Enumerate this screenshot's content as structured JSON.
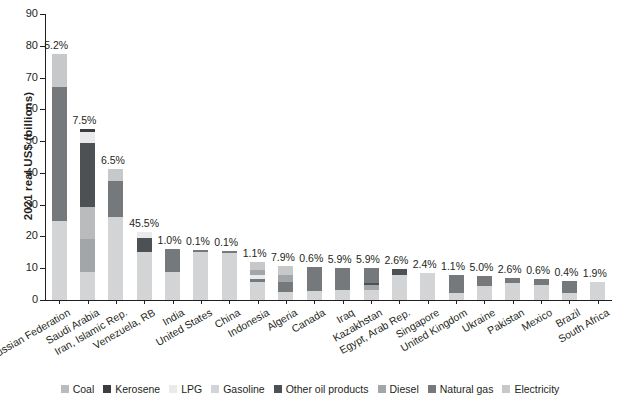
{
  "chart": {
    "type": "bar",
    "title": "",
    "ylabel": "2021 real US$ (billions)",
    "xlabel": ""
  },
  "axis": {
    "yticks": [
      "0",
      "10",
      "20",
      "30",
      "40",
      "50",
      "60",
      "70",
      "80",
      "90"
    ],
    "ymin": 0,
    "ymax": 90
  },
  "legend": {
    "items": [
      {
        "label": "Coal",
        "color": "#b9bbbd"
      },
      {
        "label": "Kerosene",
        "color": "#3b3d40"
      },
      {
        "label": "LPG",
        "color": "#e9eaeb"
      },
      {
        "label": "Gasoline",
        "color": "#d2d4d6"
      },
      {
        "label": "Other oil products",
        "color": "#4e5154"
      },
      {
        "label": "Diesel",
        "color": "#a3a6a9"
      },
      {
        "label": "Natural gas",
        "color": "#76797c"
      },
      {
        "label": "Electricity",
        "color": "#c6c8ca"
      }
    ]
  },
  "chart_data": {
    "type": "bar",
    "stacked": true,
    "title": "",
    "xlabel": "",
    "ylabel": "2021 real US$ (billions)",
    "ylim": [
      0,
      90
    ],
    "grid": false,
    "legend_position": "bottom",
    "series_order": [
      "Coal",
      "Kerosene",
      "LPG",
      "Gasoline",
      "Other oil products",
      "Diesel",
      "Natural gas",
      "Electricity"
    ],
    "categories": [
      "Russian Federation",
      "Saudi Arabia",
      "Iran, Islamic Rep.",
      "Venezuela, RB",
      "India",
      "United States",
      "China",
      "Indonesia",
      "Algeria",
      "Canada",
      "Iraq",
      "Kazakhstan",
      "Egypt, Arab Rep.",
      "Singapore",
      "United Kingdom",
      "Ukraine",
      "Pakistan",
      "Mexico",
      "Brazil",
      "South Africa"
    ],
    "bar_labels": [
      "5.2%",
      "7.5%",
      "6.5%",
      "45.5%",
      "1.0%",
      "0.1%",
      "0.1%",
      "1.1%",
      "7.9%",
      "0.6%",
      "5.9%",
      "5.9%",
      "2.6%",
      "2.4%",
      "1.1%",
      "5.0%",
      "2.6%",
      "0.6%",
      "0.4%",
      "1.9%"
    ],
    "totals": [
      77.5,
      53.8,
      41.2,
      21.5,
      16.2,
      15.8,
      15.4,
      12.0,
      10.6,
      10.4,
      10.2,
      10.0,
      9.6,
      8.4,
      8.0,
      7.4,
      6.8,
      6.5,
      5.9,
      5.8
    ],
    "stacks": [
      {
        "category": "Russian Federation",
        "segments": [
          {
            "name": "Gasoline",
            "value": 25.0
          },
          {
            "name": "Natural gas",
            "value": 42.0
          },
          {
            "name": "Electricity",
            "value": 10.5
          }
        ]
      },
      {
        "category": "Saudi Arabia",
        "segments": [
          {
            "name": "Gasoline",
            "value": 8.8
          },
          {
            "name": "Diesel",
            "value": 10.4
          },
          {
            "name": "Coal",
            "value": 10.0
          },
          {
            "name": "Other oil products",
            "value": 20.3
          },
          {
            "name": "LPG",
            "value": 3.4
          },
          {
            "name": "Kerosene",
            "value": 0.9
          }
        ]
      },
      {
        "category": "Iran, Islamic Rep.",
        "segments": [
          {
            "name": "Gasoline",
            "value": 26.0
          },
          {
            "name": "Natural gas",
            "value": 11.3
          },
          {
            "name": "Electricity",
            "value": 3.9
          }
        ]
      },
      {
        "category": "Venezuela, RB",
        "segments": [
          {
            "name": "Gasoline",
            "value": 15.2
          },
          {
            "name": "Other oil products",
            "value": 4.4
          },
          {
            "name": "LPG",
            "value": 1.9
          }
        ]
      },
      {
        "category": "India",
        "segments": [
          {
            "name": "Gasoline",
            "value": 8.8
          },
          {
            "name": "Natural gas",
            "value": 7.4
          }
        ]
      },
      {
        "category": "United States",
        "segments": [
          {
            "name": "Gasoline",
            "value": 15.0
          },
          {
            "name": "Natural gas",
            "value": 0.8
          }
        ]
      },
      {
        "category": "China",
        "segments": [
          {
            "name": "Gasoline",
            "value": 14.9
          },
          {
            "name": "Natural gas",
            "value": 0.5
          }
        ]
      },
      {
        "category": "Indonesia",
        "segments": [
          {
            "name": "Gasoline",
            "value": 5.7
          },
          {
            "name": "Natural gas",
            "value": 0.8
          },
          {
            "name": "LPG",
            "value": 1.3
          },
          {
            "name": "Diesel",
            "value": 1.6
          },
          {
            "name": "Electricity",
            "value": 2.6
          }
        ]
      },
      {
        "category": "Algeria",
        "segments": [
          {
            "name": "Gasoline",
            "value": 2.4
          },
          {
            "name": "Natural gas",
            "value": 3.2
          },
          {
            "name": "Diesel",
            "value": 2.2
          },
          {
            "name": "Electricity",
            "value": 2.8
          }
        ]
      },
      {
        "category": "Canada",
        "segments": [
          {
            "name": "Gasoline",
            "value": 2.8
          },
          {
            "name": "Natural gas",
            "value": 7.6
          }
        ]
      },
      {
        "category": "Iraq",
        "segments": [
          {
            "name": "Gasoline",
            "value": 3.0
          },
          {
            "name": "Natural gas",
            "value": 7.2
          }
        ]
      },
      {
        "category": "Kazakhstan",
        "segments": [
          {
            "name": "Gasoline",
            "value": 3.2
          },
          {
            "name": "Diesel",
            "value": 1.4
          },
          {
            "name": "Other oil products",
            "value": 0.9
          },
          {
            "name": "Natural gas",
            "value": 4.5
          }
        ]
      },
      {
        "category": "Egypt, Arab Rep.",
        "segments": [
          {
            "name": "Gasoline",
            "value": 8.0
          },
          {
            "name": "Other oil products",
            "value": 1.6
          }
        ]
      },
      {
        "category": "Singapore",
        "segments": [
          {
            "name": "Gasoline",
            "value": 8.4
          }
        ]
      },
      {
        "category": "United Kingdom",
        "segments": [
          {
            "name": "Gasoline",
            "value": 2.2
          },
          {
            "name": "Natural gas",
            "value": 5.8
          }
        ]
      },
      {
        "category": "Ukraine",
        "segments": [
          {
            "name": "Gasoline",
            "value": 4.4
          },
          {
            "name": "Natural gas",
            "value": 3.0
          }
        ]
      },
      {
        "category": "Pakistan",
        "segments": [
          {
            "name": "Gasoline",
            "value": 5.2
          },
          {
            "name": "Natural gas",
            "value": 1.6
          }
        ]
      },
      {
        "category": "Mexico",
        "segments": [
          {
            "name": "Gasoline",
            "value": 4.6
          },
          {
            "name": "Natural gas",
            "value": 1.9
          }
        ]
      },
      {
        "category": "Brazil",
        "segments": [
          {
            "name": "Gasoline",
            "value": 2.2
          },
          {
            "name": "Natural gas",
            "value": 3.7
          }
        ]
      },
      {
        "category": "South Africa",
        "segments": [
          {
            "name": "Gasoline",
            "value": 5.8
          }
        ]
      }
    ]
  }
}
